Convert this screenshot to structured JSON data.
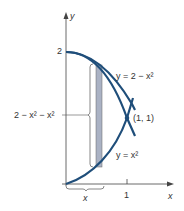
{
  "diagram": {
    "axes": {
      "x_label": "x",
      "y_label": "y",
      "x_tick": "1",
      "y_tick": "2"
    },
    "curves": [
      {
        "name": "upper",
        "label": "y = 2 − x²",
        "color": "#1f4e7a"
      },
      {
        "name": "lower",
        "label": "y = x²",
        "color": "#1f4e7a"
      }
    ],
    "intersection": {
      "label": "(1, 1)"
    },
    "strip": {
      "height_label": "2 − x² − x²",
      "width_label": "x",
      "fill": "#aab2c4"
    }
  }
}
